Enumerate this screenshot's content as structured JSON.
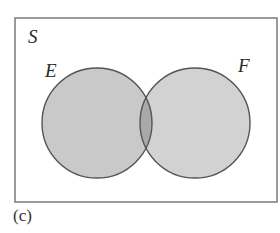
{
  "diagram": {
    "type": "venn",
    "universe_label": "S",
    "sets": [
      {
        "label": "E",
        "color": "#c9c9c9"
      },
      {
        "label": "F",
        "color": "#d2d2d2"
      }
    ],
    "intersection_color": "#a9a9a9",
    "stroke_color": "#555555",
    "frame_color": "#666666"
  },
  "caption": "(c)"
}
